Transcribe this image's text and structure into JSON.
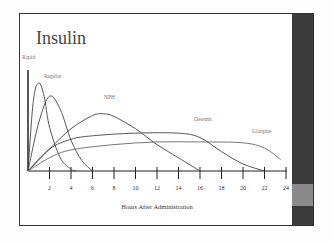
{
  "slide": {
    "title": "Insulin",
    "colors": {
      "band": "#3a3a3a",
      "band_accent": "#8a8a8a",
      "curve": "#444444",
      "label": "#777777"
    }
  },
  "chart_data": {
    "type": "line",
    "title": "Insulin",
    "xlabel": "Hours After Administration",
    "ylabel": "",
    "xlim": [
      0,
      24
    ],
    "x_ticks": [
      2,
      4,
      6,
      8,
      10,
      12,
      14,
      16,
      18,
      20,
      22,
      24
    ],
    "grid": false,
    "legend": "inline labels",
    "series": [
      {
        "name": "Rapid",
        "x": [
          0,
          0.5,
          1,
          1.5,
          2,
          3,
          4,
          4.5
        ],
        "y": [
          0,
          80,
          100,
          85,
          50,
          15,
          2,
          0
        ]
      },
      {
        "name": "Regular",
        "x": [
          0,
          1,
          2,
          3,
          4,
          5,
          6
        ],
        "y": [
          0,
          55,
          85,
          70,
          35,
          12,
          0
        ]
      },
      {
        "name": "NPH",
        "x": [
          0,
          2,
          4,
          6,
          7,
          8,
          10,
          12,
          14,
          16
        ],
        "y": [
          0,
          25,
          48,
          63,
          65,
          62,
          48,
          30,
          15,
          0
        ]
      },
      {
        "name": "Detemir",
        "x": [
          0,
          2,
          4,
          6,
          10,
          14,
          16,
          18,
          20,
          22
        ],
        "y": [
          0,
          25,
          36,
          40,
          43,
          43,
          38,
          22,
          8,
          0
        ]
      },
      {
        "name": "Glargine",
        "x": [
          0,
          2,
          4,
          8,
          12,
          16,
          20,
          22,
          23.5
        ],
        "y": [
          0,
          15,
          24,
          30,
          33,
          33,
          32,
          26,
          13
        ]
      }
    ]
  }
}
